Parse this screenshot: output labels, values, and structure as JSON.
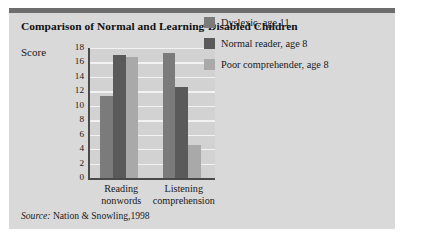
{
  "figure": {
    "title": "Comparison of Normal and Learning-Disabled Children",
    "source_keyword": "Source:",
    "source_text": "Nation & Snowling,1998"
  },
  "colors": {
    "card_background": "#d9d9d9",
    "top_rule": "#6d6d6d",
    "plot_background": "#d2d2d2",
    "gridline": "#f2f2f2",
    "axis": "#4a4a4a",
    "series_dyslexic": "#7b7b7b",
    "series_normal": "#5a5a5a",
    "series_poor": "#a9a9a9"
  },
  "chart_data": {
    "type": "bar",
    "title": "Comparison of Normal and Learning-Disabled Children",
    "xlabel": "",
    "ylabel": "Score",
    "ylim": [
      0,
      18
    ],
    "yticks": [
      18,
      16,
      14,
      12,
      10,
      8,
      6,
      4,
      2,
      0
    ],
    "grid": true,
    "legend_position": "right",
    "categories": [
      "Reading nonwords",
      "Listening comprehension"
    ],
    "category_lines": [
      [
        "Reading",
        "nonwords"
      ],
      [
        "Listening",
        "comprehension"
      ]
    ],
    "series": [
      {
        "name": "Dyslexic, age 11",
        "color": "#7b7b7b",
        "values": [
          11.4,
          17.3
        ]
      },
      {
        "name": "Normal reader, age 8",
        "color": "#5a5a5a",
        "values": [
          17.0,
          12.6
        ]
      },
      {
        "name": "Poor comprehender, age 8",
        "color": "#a9a9a9",
        "values": [
          16.7,
          4.6
        ]
      }
    ]
  }
}
